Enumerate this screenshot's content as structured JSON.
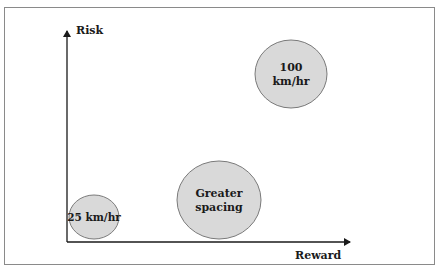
{
  "diagram": {
    "axes": {
      "y_label": "Risk",
      "x_label": "Reward"
    },
    "bubbles": [
      {
        "label_lines": [
          "100",
          "km/hr"
        ],
        "cx": 291,
        "cy": 74,
        "rx": 36,
        "ry": 34
      },
      {
        "label_lines": [
          "Greater",
          "spacing"
        ],
        "cx": 219,
        "cy": 200,
        "rx": 42,
        "ry": 39
      },
      {
        "label_lines": [
          "25 km/hr"
        ],
        "cx": 94,
        "cy": 217,
        "rx": 25,
        "ry": 22
      }
    ],
    "colors": {
      "frame_border": "#8a8a8a",
      "axis": "#1a1a1a",
      "bubble_fill": "#d9d9d9",
      "bubble_stroke": "#7a7a7a",
      "text": "#1a1a1a"
    }
  }
}
